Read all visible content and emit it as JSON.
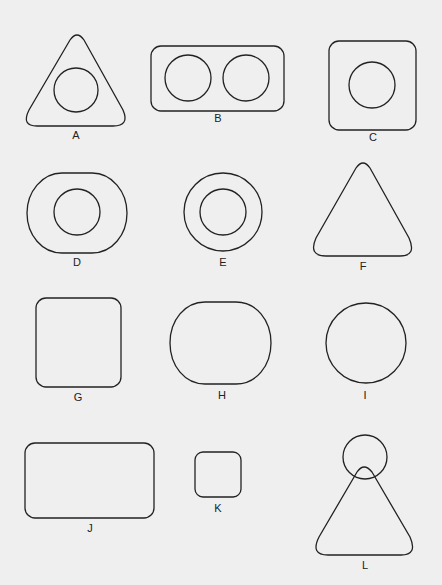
{
  "figure": {
    "background": "#efefef",
    "stroke_color": "#222222",
    "shapes": [
      {
        "id": "A",
        "label": "A",
        "description": "Rounded triangle with inner circle"
      },
      {
        "id": "B",
        "label": "B",
        "description": "Rounded rectangle with two circles"
      },
      {
        "id": "C",
        "label": "C",
        "description": "Rounded square with inner circle"
      },
      {
        "id": "D",
        "label": "D",
        "description": "Rounded oval with inner circle"
      },
      {
        "id": "E",
        "label": "E",
        "description": "Concentric circles"
      },
      {
        "id": "F",
        "label": "F",
        "description": "Rounded triangle"
      },
      {
        "id": "G",
        "label": "G",
        "description": "Rounded square"
      },
      {
        "id": "H",
        "label": "H",
        "description": "Rounded oval"
      },
      {
        "id": "I",
        "label": "I",
        "description": "Circle"
      },
      {
        "id": "J",
        "label": "J",
        "description": "Rounded rectangle"
      },
      {
        "id": "K",
        "label": "K",
        "description": "Small rounded square"
      },
      {
        "id": "L",
        "label": "L",
        "description": "Rounded triangle overlapping a circle at apex"
      }
    ]
  }
}
